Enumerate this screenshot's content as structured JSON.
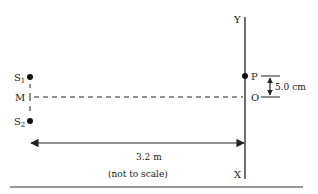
{
  "diagram": {
    "type": "double-slit interference setup",
    "sources": {
      "s1": {
        "label": "S",
        "subscript": "1"
      },
      "s2": {
        "label": "S",
        "subscript": "2"
      },
      "midpoint": {
        "label": "M"
      }
    },
    "screen": {
      "top_label": "Y",
      "bottom_label": "X",
      "point_p": "P",
      "point_o": "O"
    },
    "separation_po": "5.0 cm",
    "distance_to_screen": "3.2 m",
    "note": "(not to scale)"
  }
}
